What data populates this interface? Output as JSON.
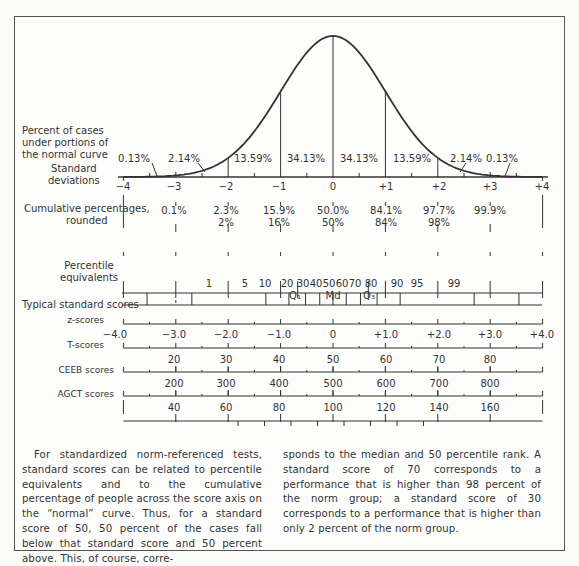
{
  "figure": {
    "row_labels": {
      "percent_cases": [
        "Percent of cases",
        "under portions of",
        "the normal curve"
      ],
      "std_dev": [
        "Standard",
        "deviations"
      ],
      "cumulative": [
        "Cumulative percentages,",
        "rounded"
      ],
      "percentile": [
        "Percentile",
        "equivalents"
      ],
      "typical": "Typical standard scores",
      "z": "z-scores",
      "t": "T-scores",
      "ceeb": "CEEB scores",
      "agct": "AGCT scores"
    },
    "area_percents": [
      "0.13%",
      "2.14%",
      "13.59%",
      "34.13%",
      "34.13%",
      "13.59%",
      "2.14%",
      "0.13%"
    ],
    "sd_labels": [
      "−4",
      "−3",
      "−2",
      "−1",
      "0",
      "+1",
      "+2",
      "+3",
      "+4"
    ],
    "cumulative_exact": [
      "0.1%",
      "2.3%",
      "15.9%",
      "50.0%",
      "84.1%",
      "97.7%",
      "99.9%"
    ],
    "cumulative_rounded": [
      "2%",
      "16%",
      "50%",
      "84%",
      "98%"
    ],
    "percentile_labels": [
      "1",
      "5",
      "10",
      "20",
      "30",
      "40",
      "50",
      "60",
      "70",
      "80",
      "90",
      "95",
      "99"
    ],
    "quartile_labels": {
      "q1": "Q₁",
      "md": "Md",
      "q3": "Q₃"
    },
    "z_labels": [
      "−4.0",
      "−3.0",
      "−2.0",
      "−1.0",
      "0",
      "+1.0",
      "+2.0",
      "+3.0",
      "+4.0"
    ],
    "t_labels": [
      "20",
      "30",
      "40",
      "50",
      "60",
      "70",
      "80"
    ],
    "ceeb_labels": [
      "200",
      "300",
      "400",
      "500",
      "600",
      "700",
      "800"
    ],
    "agct_labels": [
      "40",
      "60",
      "80",
      "100",
      "120",
      "140",
      "160"
    ]
  },
  "text": {
    "left": "For standardized norm-referenced tests, standard scores can be related to percentile equivalents and to the cumulative percentage of people across the score axis on the “normal” curve. Thus, for a standard score of 50, 50 percent of the cases fall below that standard score and 50 percent above. This, of course, corre-",
    "right": "sponds to the median and 50 percentile rank. A standard score of 70 corresponds to a performance that is higher than 98 percent of the norm group; a standard score of 30 corresponds to a performance that is higher than only 2 percent of the norm group."
  }
}
